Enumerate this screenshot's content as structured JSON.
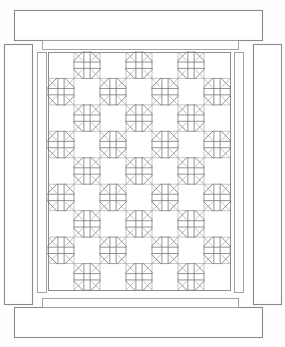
{
  "figure": {
    "kind": "quilt-pattern-diagram",
    "title": "",
    "line_color": "#6f6f6f",
    "grid_color": "#9e9e9e",
    "border_color": "#8a8a8a",
    "background": "#ffffff",
    "canvas": {
      "width": 285,
      "height": 347
    }
  },
  "outer_borders": [
    {
      "name": "outer-border-top",
      "x": 14,
      "y": 10,
      "w": 248,
      "h": 30
    },
    {
      "name": "outer-border-bottom",
      "x": 14,
      "y": 307,
      "w": 248,
      "h": 30
    },
    {
      "name": "outer-border-left",
      "x": 4,
      "y": 44,
      "w": 28,
      "h": 260
    },
    {
      "name": "outer-border-right",
      "x": 253,
      "y": 44,
      "w": 28,
      "h": 260
    }
  ],
  "inner_sashing": [
    {
      "name": "inner-sash-top",
      "x": 42,
      "y": 40,
      "w": 196,
      "h": 9
    },
    {
      "name": "inner-sash-bottom",
      "x": 42,
      "y": 298,
      "w": 196,
      "h": 9
    },
    {
      "name": "inner-sash-left",
      "x": 37,
      "y": 52,
      "w": 9,
      "h": 240
    },
    {
      "name": "inner-sash-right",
      "x": 234,
      "y": 52,
      "w": 9,
      "h": 240
    }
  ],
  "quilt_body": {
    "name": "quilt-body",
    "x": 48,
    "y": 52,
    "w": 182,
    "h": 238,
    "columns": 7,
    "rows": 9,
    "cell_w": 26,
    "cell_h": 26.4,
    "block_types": [
      "plain",
      "star"
    ],
    "layout": [
      [
        "plain",
        "star",
        "plain",
        "star",
        "plain",
        "star",
        "plain"
      ],
      [
        "star",
        "plain",
        "star",
        "plain",
        "star",
        "plain",
        "star"
      ],
      [
        "plain",
        "star",
        "plain",
        "star",
        "plain",
        "star",
        "plain"
      ],
      [
        "star",
        "plain",
        "star",
        "plain",
        "star",
        "plain",
        "star"
      ],
      [
        "plain",
        "star",
        "plain",
        "star",
        "plain",
        "star",
        "plain"
      ],
      [
        "star",
        "plain",
        "star",
        "plain",
        "star",
        "plain",
        "star"
      ],
      [
        "plain",
        "star",
        "plain",
        "star",
        "plain",
        "star",
        "plain"
      ],
      [
        "star",
        "plain",
        "star",
        "plain",
        "star",
        "plain",
        "star"
      ],
      [
        "plain",
        "star",
        "plain",
        "star",
        "plain",
        "star",
        "plain"
      ]
    ],
    "star_block": {
      "description": "octagon formed by four corner triangles, with a horizontal and vertical double-line cross through the centre",
      "corner_triangle_fraction": 0.33,
      "cross_line_offset": 0.12
    }
  }
}
